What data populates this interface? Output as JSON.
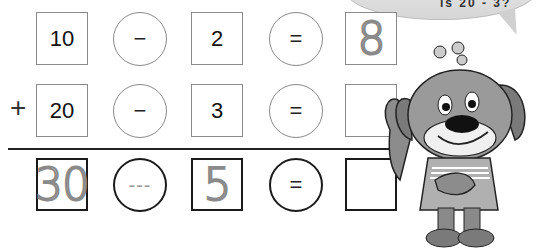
{
  "speech_bubble": {
    "text": "is 20 - 3?"
  },
  "rows": [
    {
      "operand": "10",
      "operator": "−",
      "subtrahend": "2",
      "equals": "=",
      "result": "8",
      "result_style": "traced"
    },
    {
      "prefix": "+",
      "operand": "20",
      "operator": "−",
      "subtrahend": "3",
      "equals": "=",
      "result": ""
    },
    {
      "operand": "30",
      "operand_style": "traced",
      "operator": "---",
      "operator_style": "traced",
      "subtrahend": "5",
      "subtrahend_style": "traced",
      "equals": "=",
      "result": ""
    }
  ],
  "mascot": {
    "description": "cartoon dog character waving"
  }
}
